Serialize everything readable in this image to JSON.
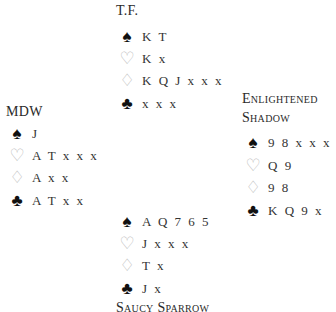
{
  "north": {
    "name": "T.F.",
    "spades": "K T",
    "hearts": "K x",
    "diamonds": "K Q J x x x",
    "clubs": "x x x"
  },
  "west": {
    "name": "MDW",
    "spades": "J",
    "hearts": "A T x x x",
    "diamonds": "A x x",
    "clubs": "A T x x"
  },
  "east": {
    "name_line1": "Enlightened",
    "name_line2": "Shadow",
    "spades": "9 8 x x x",
    "hearts": "Q 9",
    "diamonds": "9 8",
    "clubs": "K Q 9 x"
  },
  "south": {
    "name": "Saucy Sparrow",
    "spades": "A Q 7 6 5",
    "hearts": "J x x x",
    "diamonds": "T x",
    "clubs": "J x"
  },
  "suits": {
    "spade": "♠",
    "heart": "♡",
    "diamond": "♢",
    "club": "♣"
  }
}
